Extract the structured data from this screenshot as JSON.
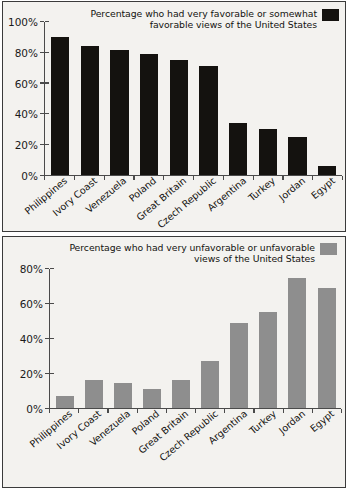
{
  "chart_data": [
    {
      "type": "bar",
      "panel": "top",
      "title": "",
      "legend_label": "Percentage who had very favorable or somewhat favorable views of the United States",
      "legend_position": "top-right",
      "series_color": "#14120f",
      "categories": [
        "Philippines",
        "Ivory Coast",
        "Venezuela",
        "Poland",
        "Great Britain",
        "Czech Republic",
        "Argentina",
        "Turkey",
        "Jordan",
        "Egypt"
      ],
      "values": [
        90,
        84,
        82,
        79,
        75,
        71,
        34,
        30,
        25,
        6
      ],
      "xlabel": "",
      "ylabel": "",
      "ylim": [
        0,
        100
      ],
      "yticks": [
        "0%",
        "20%",
        "40%",
        "60%",
        "80%",
        "100%"
      ],
      "ytick_values": [
        0,
        20,
        40,
        60,
        80,
        100
      ],
      "grid": false
    },
    {
      "type": "bar",
      "panel": "bottom",
      "title": "",
      "legend_label": "Percentage who had very unfavorable or unfavorable views of the United States",
      "legend_position": "top-right",
      "series_color": "#8e8e8e",
      "categories": [
        "Philippines",
        "Ivory Coast",
        "Venezuela",
        "Poland",
        "Great Britain",
        "Czech Republic",
        "Argentina",
        "Turkey",
        "Jordan",
        "Egypt"
      ],
      "values": [
        7,
        16,
        14,
        11,
        16,
        27,
        49,
        55,
        75,
        69
      ],
      "xlabel": "",
      "ylabel": "",
      "ylim": [
        0,
        80
      ],
      "yticks": [
        "0%",
        "20%",
        "40%",
        "60%",
        "80%"
      ],
      "ytick_values": [
        0,
        20,
        40,
        60,
        80
      ],
      "grid": false
    }
  ]
}
